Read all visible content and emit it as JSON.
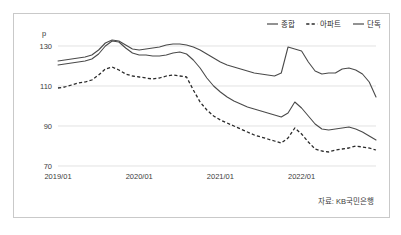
{
  "figure": {
    "unit_label": "p",
    "source_note": "자료: KB국민은행"
  },
  "legend": {
    "items": [
      {
        "label": "종합",
        "style": "solid"
      },
      {
        "label": "아파트",
        "style": "dashed"
      },
      {
        "label": "단독",
        "style": "solid"
      }
    ]
  },
  "chart_data": {
    "type": "line",
    "title": "",
    "xlabel": "",
    "ylabel": "p",
    "ylim": [
      70,
      138
    ],
    "yticks": [
      70,
      90,
      110,
      130
    ],
    "ytick_labels": [
      "70",
      "90",
      "110",
      "130"
    ],
    "xticks": [
      "2019/01",
      "2020/01",
      "2021/01",
      "2022/01"
    ],
    "xtick_positions": [
      0,
      12,
      24,
      36
    ],
    "grid": true,
    "legend_position": "top-right",
    "x": [
      0,
      1,
      2,
      3,
      4,
      5,
      6,
      7,
      8,
      9,
      10,
      11,
      12,
      13,
      14,
      15,
      16,
      17,
      18,
      19,
      20,
      21,
      22,
      23,
      24,
      25,
      26,
      27,
      28,
      29,
      30,
      31,
      32,
      33,
      34,
      35,
      36,
      37,
      38,
      39,
      40,
      41,
      42,
      43,
      44,
      45,
      46,
      47
    ],
    "series": [
      {
        "name": "종합",
        "style": "solid",
        "values": [
          120.5,
          121.0,
          121.5,
          122.0,
          122.5,
          123.5,
          126.0,
          130.0,
          132.5,
          132.0,
          129.0,
          126.5,
          125.5,
          125.5,
          125.0,
          125.0,
          125.5,
          126.5,
          127.0,
          126.0,
          123.0,
          119.0,
          114.0,
          110.0,
          107.0,
          104.5,
          102.5,
          101.0,
          99.5,
          98.5,
          97.5,
          96.5,
          95.5,
          94.5,
          96.5,
          102.0,
          99.0,
          95.0,
          91.0,
          88.5,
          88.0,
          88.5,
          89.0,
          89.5,
          88.5,
          87.0,
          85.0,
          83.0
        ]
      },
      {
        "name": "아파트",
        "style": "dashed",
        "values": [
          109.0,
          109.5,
          110.5,
          111.5,
          112.0,
          113.0,
          115.5,
          118.5,
          119.5,
          118.0,
          116.0,
          115.0,
          114.5,
          114.0,
          113.5,
          114.0,
          115.0,
          115.5,
          115.0,
          114.5,
          108.0,
          102.0,
          98.0,
          95.0,
          93.0,
          91.5,
          90.0,
          88.5,
          87.0,
          85.5,
          84.5,
          83.5,
          82.5,
          81.5,
          84.0,
          89.0,
          86.0,
          82.0,
          78.5,
          77.5,
          77.0,
          78.0,
          78.5,
          79.0,
          80.0,
          79.5,
          79.0,
          78.0
        ]
      },
      {
        "name": "단독",
        "style": "solid",
        "values": [
          122.5,
          123.0,
          123.5,
          124.0,
          124.5,
          125.5,
          128.0,
          131.5,
          133.0,
          132.5,
          130.5,
          128.5,
          128.0,
          128.5,
          129.0,
          129.5,
          130.5,
          131.0,
          131.0,
          130.5,
          129.5,
          128.0,
          126.0,
          124.0,
          122.0,
          120.5,
          119.5,
          118.5,
          117.5,
          116.5,
          116.0,
          115.5,
          115.0,
          116.5,
          129.5,
          128.5,
          127.5,
          122.0,
          117.5,
          116.0,
          116.5,
          116.5,
          118.5,
          119.0,
          118.0,
          116.0,
          112.0,
          104.5
        ]
      }
    ]
  }
}
